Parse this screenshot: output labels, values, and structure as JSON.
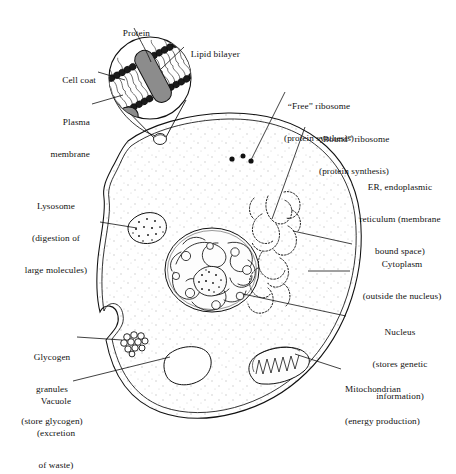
{
  "figure": {
    "type": "labeled-biological-diagram",
    "background_color": "#ffffff",
    "ink_color": "#111111",
    "cytoplasm_stipple_color": "#bdbdbd",
    "membrane_protein_fill": "#8c8c8c",
    "membrane_head_fill": "#1a1a1a"
  },
  "labels": {
    "protein": "Protein",
    "lipid_bilayer": "Lipid bilayer",
    "cell_coat": "Cell coat",
    "plasma_membrane_l1": "Plasma",
    "plasma_membrane_l2": "membrane",
    "free_ribosome_l1": "“Free” ribosome",
    "free_ribosome_l2": "(protein synthesis)",
    "bound_ribosome_l1": "“Bound” ribosome",
    "bound_ribosome_l2": "(protein synthesis)",
    "er_l1": "ER, endoplasmic",
    "er_l2": "reticulum (membrane",
    "er_l3": "bound space)",
    "cytoplasm_l1": "Cytoplasm",
    "cytoplasm_l2": "(outside the nucleus)",
    "nucleus_l1": "Nucleus",
    "nucleus_l2": "(stores genetic",
    "nucleus_l3": "information)",
    "mitochondrion_l1": "Mitochondrian",
    "mitochondrion_l2": "(energy production)",
    "lysosome_l1": "Lysosome",
    "lysosome_l2": "(digestion of",
    "lysosome_l3": "large molecules)",
    "glycogen_l1": "Glycogen",
    "glycogen_l2": "granules",
    "glycogen_l3": "(store glycogen)",
    "vacuole_l1": "Vacuole",
    "vacuole_l2": "(excretion",
    "vacuole_l3": "of waste)"
  },
  "structures": [
    {
      "name": "plasma-membrane",
      "description": "double-line cell boundary with wavy invaginations"
    },
    {
      "name": "cytoplasm",
      "description": "stippled interior of cell"
    },
    {
      "name": "nucleus",
      "description": "large round organelle with chromatin loops and speckled nucleolus"
    },
    {
      "name": "endoplasmic-reticulum",
      "description": "network of wavy tubules studded with ribosome dots"
    },
    {
      "name": "free-ribosomes",
      "description": "three isolated black dots in cytoplasm"
    },
    {
      "name": "lysosome",
      "description": "oval organelle filled with dark speckles"
    },
    {
      "name": "mitochondrion",
      "description": "elongated oval with zigzag cristae"
    },
    {
      "name": "glycogen-granules",
      "description": "cluster of small circles"
    },
    {
      "name": "vacuole",
      "description": "empty rounded oval"
    },
    {
      "name": "membrane-magnifier",
      "description": "circular inset showing phospholipid bilayer with embedded proteins"
    }
  ]
}
